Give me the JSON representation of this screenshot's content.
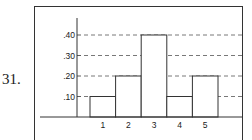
{
  "problem": {
    "number": "31."
  },
  "chart_data": {
    "type": "bar",
    "title": "",
    "xlabel": "",
    "ylabel": "",
    "categories": [
      "1",
      "2",
      "3",
      "4",
      "5"
    ],
    "values": [
      0.1,
      0.2,
      0.4,
      0.1,
      0.2
    ],
    "y_ticks": [
      ".10",
      ".20",
      ".30",
      ".40"
    ],
    "y_tick_values": [
      0.1,
      0.2,
      0.3,
      0.4
    ],
    "ylim": [
      0,
      0.45
    ],
    "grid": {
      "horizontal": true,
      "style": "dashed"
    },
    "legend": null,
    "bar_style": {
      "fill": "#ffffff",
      "stroke": "#333333"
    }
  },
  "layout": {
    "baseline_y": 117,
    "bars_x0": 90,
    "bar_width": 25.6,
    "px_per_unit": 205,
    "yaxis_x": 77,
    "grid_x0": 84,
    "grid_x1": 243,
    "baseline_x0": 40,
    "baseline_x1": 243,
    "yaxis_top": 18
  }
}
